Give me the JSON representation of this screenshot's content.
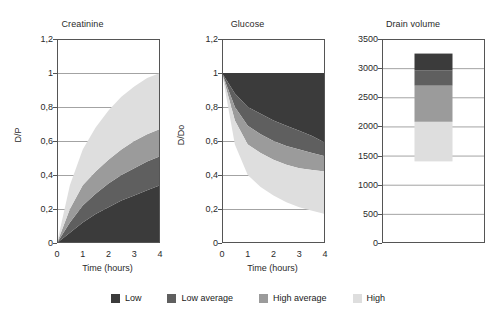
{
  "figure": {
    "legend": {
      "position": "bottom-center",
      "items": [
        {
          "label": "Low",
          "color": "#3b3b3b"
        },
        {
          "label": "Low average",
          "color": "#5f5f5f"
        },
        {
          "label": "High average",
          "color": "#9b9b9b"
        },
        {
          "label": "High",
          "color": "#dedede"
        }
      ]
    }
  },
  "chart_data": [
    {
      "type": "area",
      "title": "Creatinine",
      "xlabel": "Time (hours)",
      "ylabel": "D/P",
      "xlim": [
        0,
        4
      ],
      "ylim": [
        0,
        1.2
      ],
      "xticks": [
        "0",
        "1",
        "2",
        "3",
        "4"
      ],
      "yticks": [
        "0",
        "0,2",
        "0,4",
        "0,6",
        "0,8",
        "1",
        "1,2"
      ],
      "grid": true,
      "x": [
        0,
        0.5,
        1,
        1.5,
        2,
        2.5,
        3,
        3.5,
        4
      ],
      "series": [
        {
          "name": "Low",
          "color": "#3b3b3b",
          "lower": [
            0,
            0,
            0,
            0,
            0,
            0,
            0,
            0,
            0
          ],
          "upper": [
            0.0,
            0.06,
            0.12,
            0.17,
            0.21,
            0.25,
            0.28,
            0.31,
            0.34
          ]
        },
        {
          "name": "Low average",
          "color": "#5f5f5f",
          "lower": [
            0.0,
            0.06,
            0.12,
            0.17,
            0.21,
            0.25,
            0.28,
            0.31,
            0.34
          ],
          "upper": [
            0.0,
            0.12,
            0.22,
            0.29,
            0.35,
            0.4,
            0.44,
            0.48,
            0.51
          ]
        },
        {
          "name": "High average",
          "color": "#9b9b9b",
          "lower": [
            0.0,
            0.12,
            0.22,
            0.29,
            0.35,
            0.4,
            0.44,
            0.48,
            0.51
          ],
          "upper": [
            0.0,
            0.2,
            0.34,
            0.42,
            0.49,
            0.55,
            0.6,
            0.64,
            0.67
          ]
        },
        {
          "name": "High",
          "color": "#dedede",
          "lower": [
            0.0,
            0.2,
            0.34,
            0.42,
            0.49,
            0.55,
            0.6,
            0.64,
            0.67
          ],
          "upper": [
            0.0,
            0.34,
            0.55,
            0.68,
            0.78,
            0.86,
            0.92,
            0.97,
            1.0
          ]
        }
      ]
    },
    {
      "type": "area",
      "title": "Glucose",
      "xlabel": "Time (hours)",
      "ylabel": "D/Do",
      "xlim": [
        0,
        4
      ],
      "ylim": [
        0,
        1.2
      ],
      "xticks": [
        "0",
        "1",
        "2",
        "3",
        "4"
      ],
      "yticks": [
        "0",
        "0,2",
        "0,4",
        "0,6",
        "0,8",
        "1",
        "1,2"
      ],
      "grid": true,
      "x": [
        0,
        0.5,
        1,
        1.5,
        2,
        2.5,
        3,
        3.5,
        4
      ],
      "series": [
        {
          "name": "Low",
          "color": "#3b3b3b",
          "lower": [
            1.0,
            0.88,
            0.8,
            0.76,
            0.72,
            0.69,
            0.66,
            0.63,
            0.59
          ],
          "upper": [
            1.0,
            1.0,
            1.0,
            1.0,
            1.0,
            1.0,
            1.0,
            1.0,
            1.0
          ]
        },
        {
          "name": "Low average",
          "color": "#5f5f5f",
          "lower": [
            1.0,
            0.8,
            0.69,
            0.64,
            0.6,
            0.57,
            0.55,
            0.53,
            0.51
          ],
          "upper": [
            1.0,
            0.88,
            0.8,
            0.76,
            0.72,
            0.69,
            0.66,
            0.63,
            0.59
          ]
        },
        {
          "name": "High average",
          "color": "#9b9b9b",
          "lower": [
            1.0,
            0.72,
            0.58,
            0.53,
            0.49,
            0.46,
            0.44,
            0.43,
            0.42
          ],
          "upper": [
            1.0,
            0.8,
            0.69,
            0.64,
            0.6,
            0.57,
            0.55,
            0.53,
            0.51
          ]
        },
        {
          "name": "High",
          "color": "#dedede",
          "lower": [
            1.0,
            0.58,
            0.4,
            0.33,
            0.28,
            0.24,
            0.21,
            0.19,
            0.17
          ],
          "upper": [
            1.0,
            0.72,
            0.58,
            0.53,
            0.49,
            0.46,
            0.44,
            0.43,
            0.42
          ]
        }
      ]
    },
    {
      "type": "bar",
      "title": "Drain volume",
      "xlabel": "",
      "ylabel": "",
      "ylim": [
        0,
        3500
      ],
      "yticks": [
        "0",
        "500",
        "1000",
        "1500",
        "2000",
        "2500",
        "3000",
        "3500"
      ],
      "grid": true,
      "categories": [
        "Drain volume"
      ],
      "stacked_segments": [
        {
          "name": "High",
          "color": "#dedede",
          "from": 1400,
          "to": 2080
        },
        {
          "name": "High average",
          "color": "#9b9b9b",
          "from": 2080,
          "to": 2700
        },
        {
          "name": "Low average",
          "color": "#5f5f5f",
          "from": 2700,
          "to": 2960
        },
        {
          "name": "Low",
          "color": "#3b3b3b",
          "from": 2960,
          "to": 3250
        }
      ]
    }
  ]
}
